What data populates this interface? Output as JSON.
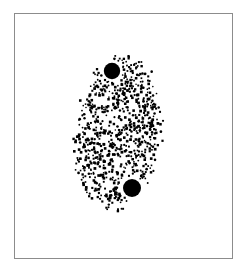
{
  "figure": {
    "kind": "stipple-illustration",
    "background_color": "#ffffff",
    "ink_color": "#000000",
    "width": 247,
    "height": 274,
    "caption": "",
    "title": ""
  },
  "frame": {
    "name": "figure-border",
    "x": 14,
    "y": 13,
    "width": 219,
    "height": 246,
    "border_color": "#8c8c8c",
    "border_width": 1,
    "fill": "#ffffff"
  },
  "chart_data": {
    "type": "scatter",
    "title": "",
    "xlabel": "",
    "ylabel": "",
    "xlim": [
      14,
      233
    ],
    "ylim": [
      13,
      259
    ],
    "grid": false,
    "legend": null,
    "series": [
      {
        "name": "stipple-dots",
        "color": "#000000",
        "marker": "square",
        "marker_size": 2.1,
        "count": 820,
        "distribution": "ellipse-filled-random-jitter",
        "region": {
          "shape": "ellipse",
          "cx": 118,
          "cy": 133,
          "rx": 45,
          "ry": 80,
          "rotation_deg": 8
        },
        "density_profile": "denser-toward-center, ragged-falloff-at-edge",
        "edge_feather": 0.16
      },
      {
        "name": "nucleoli",
        "color": "#000000",
        "marker": "circle",
        "count": 2,
        "points": [
          {
            "label": "upper-nucleolus",
            "x": 112,
            "y": 71,
            "r": 8.2
          },
          {
            "label": "lower-nucleolus",
            "x": 132,
            "y": 188,
            "r": 9.0
          }
        ],
        "halo": {
          "description": "dot-free clearing ring around each nucleolus",
          "radius_multiplier": 1.35
        }
      }
    ]
  },
  "render": {
    "seed": 20240917,
    "dot_min_size": 1.5,
    "dot_max_size": 2.8,
    "jitter": 1.6
  }
}
